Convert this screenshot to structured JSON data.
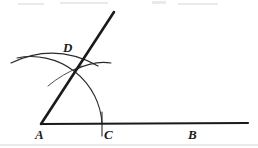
{
  "figure": {
    "kind": "geometry-construction-diagram",
    "width": 258,
    "height": 148,
    "background_color": "#ffffff",
    "ink_color": "#1a1a1a",
    "arc_color": "#2a2a2a"
  },
  "labels": {
    "A": {
      "text": "A",
      "x": 35,
      "y": 128
    },
    "B": {
      "text": "B",
      "x": 188,
      "y": 128
    },
    "C": {
      "text": "C",
      "x": 104,
      "y": 128
    },
    "D": {
      "text": "D",
      "x": 63,
      "y": 41
    }
  },
  "points": {
    "A": {
      "x": 41,
      "y": 124
    },
    "B": {
      "x": 248,
      "y": 123
    },
    "C": {
      "x": 102,
      "y": 124
    },
    "D": {
      "x": 77,
      "y": 63
    },
    "ray_tip": {
      "x": 114,
      "y": 12
    }
  },
  "geometry": {
    "base_line": {
      "from_x": 41,
      "from_y": 124,
      "to_x": 248,
      "to_y": 123,
      "stroke_width": 2.2
    },
    "ray_AD": {
      "from_x": 41,
      "from_y": 124,
      "to_x": 114,
      "to_y": 12,
      "stroke_width": 2.6
    },
    "main_arc": {
      "center_x": 41,
      "center_y": 124,
      "radius": 71,
      "start_x": 17,
      "start_y": 58,
      "end_x": 102,
      "end_y": 124,
      "stroke_width": 1.1,
      "note": "arc centered at A through D and C"
    },
    "arc_long_left": {
      "path": "M 11 63 Q 55 42 98 66",
      "stroke_width": 1.2,
      "note": "broad flat construction arc sweeping from left through D"
    },
    "arc_right": {
      "path": "M 74 70 Q 95 60 111 63",
      "stroke_width": 1.2,
      "note": "short construction arc extending right of D"
    },
    "arc_lower_left": {
      "path": "M 48 86 Q 62 74 82 66",
      "stroke_width": 0.9,
      "note": "thin construction arc descending left from D"
    },
    "tick_C": {
      "x": 102,
      "top_y": 112,
      "bottom_y": 136,
      "stroke_width": 1.1
    }
  },
  "artifacts": [
    {
      "x": 18,
      "y": 3,
      "w": 26,
      "h": 2
    },
    {
      "x": 60,
      "y": 2,
      "w": 48,
      "h": 2
    },
    {
      "x": 152,
      "y": 1,
      "w": 14,
      "h": 3
    },
    {
      "x": 178,
      "y": 3,
      "w": 40,
      "h": 2
    },
    {
      "x": 0,
      "y": 144,
      "w": 258,
      "h": 2
    }
  ]
}
